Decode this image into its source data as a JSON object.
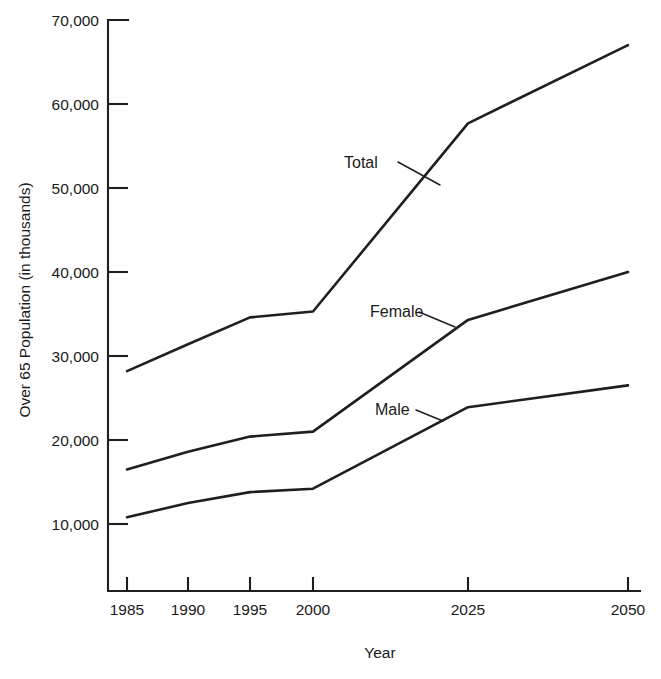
{
  "chart_data": {
    "type": "line",
    "title": "",
    "xlabel": "Year",
    "ylabel": "Over 65 Population (in thousands)",
    "categories": [
      "1985",
      "1990",
      "1995",
      "2000",
      "2025",
      "2050"
    ],
    "x": [
      1985,
      1990,
      1995,
      2000,
      2025,
      2050
    ],
    "xtick_labels": [
      "1985",
      "1990",
      "1995",
      "2000",
      "2025",
      "2050"
    ],
    "ytick_labels": [
      "10,000",
      "20,000",
      "30,000",
      "40,000",
      "50,000",
      "60,000",
      "70,000"
    ],
    "ytick_values": [
      10000,
      20000,
      30000,
      40000,
      50000,
      60000,
      70000
    ],
    "ylim": [
      0,
      70000
    ],
    "grid": false,
    "legend_position": "inline-annotations",
    "series": [
      {
        "name": "Total",
        "label": "Total",
        "values": [
          28200,
          31400,
          34600,
          35300,
          57700,
          67000
        ]
      },
      {
        "name": "Female",
        "label": "Female",
        "values": [
          16500,
          18600,
          20400,
          21000,
          34300,
          40000
        ]
      },
      {
        "name": "Male",
        "label": "Male",
        "values": [
          10800,
          12500,
          13800,
          14200,
          23900,
          26500
        ]
      }
    ],
    "annotations": [
      {
        "text": "Total",
        "series": "Total"
      },
      {
        "text": "Female",
        "series": "Female"
      },
      {
        "text": "Male",
        "series": "Male"
      }
    ]
  }
}
